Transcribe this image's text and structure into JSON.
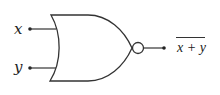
{
  "diagram": {
    "type": "logic-gate",
    "gate": "NOR",
    "inputs": [
      {
        "label": "x"
      },
      {
        "label": "y"
      }
    ],
    "output": {
      "label": "x + y",
      "overline": true
    },
    "colors": {
      "stroke": "#333333",
      "background": "#ffffff"
    }
  }
}
